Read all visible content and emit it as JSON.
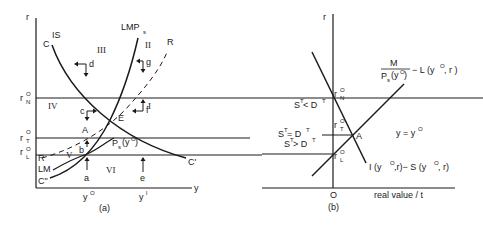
{
  "panel_a": {
    "caption": "(a)",
    "axis_y_label": "r",
    "axis_x_label": "y",
    "rates": {
      "rN": "r",
      "rN_sup": "O",
      "rN_sub": "N",
      "rT": "r",
      "rT_sup": "O",
      "rT_sub": "T",
      "rL": "r",
      "rL_sup": "O",
      "rL_sub": "L"
    },
    "x_ticks": {
      "y0": "y",
      "y0_sup": "O",
      "y1": "y",
      "y1_sup": "l"
    },
    "curves": {
      "IS": "IS",
      "C": "C",
      "LMPs": "LMP",
      "LMPs_sub": "s",
      "R_top": "R",
      "R_bottom": "R",
      "LM": "LM",
      "C_prime": "C'",
      "C_dbl": "C\"",
      "Ps": "P",
      "Ps_sub": "s",
      "Ps_arg": "(y",
      "Ps_arg_sup": "O",
      "Ps_close": ")"
    },
    "regions": [
      "I",
      "II",
      "III",
      "IV",
      "V",
      "VI"
    ],
    "points": {
      "E": "E",
      "A": "A",
      "b": "b"
    },
    "arrows": {
      "a": "a",
      "c": "c",
      "d": "d",
      "e": "e",
      "f": "f",
      "g": "g"
    }
  },
  "panel_b": {
    "caption": "(b)",
    "axis_y_label": "r",
    "axis_x_label": "real value / t",
    "origin": "O",
    "rates": {
      "rN": "r",
      "rN_sup": "O",
      "rN_sub": "N",
      "rT": "r",
      "rT_sup": "O",
      "rT_sub": "T",
      "rL": "r",
      "rL_sup": "O",
      "rL_sub": "L"
    },
    "conditions": {
      "lt": "S",
      "lt_sup": "T",
      "lt_op": " < D",
      "lt_sup2": "T",
      "eq": "S",
      "eq_sup": "T",
      "eq_op": " = D",
      "eq_sup2": "T",
      "gt": "S",
      "gt_sup": "T",
      "gt_op": " > D",
      "gt_sup2": "T"
    },
    "point_A": "A",
    "y_eq": "y = y",
    "y_eq_sup": "O",
    "money_curve": {
      "num": "M",
      "den": "P",
      "den_sub": "s",
      "den_arg": "(y",
      "den_sup": "O",
      "den_close": ")",
      "rest": "− L (y",
      "rest_sup": "O",
      "rest_tail": " , r )"
    },
    "is_curve": {
      "a": "I (y",
      "a_sup": "O",
      "b": ",r)− S (y",
      "b_sup": "O",
      "c": ", r)"
    }
  }
}
